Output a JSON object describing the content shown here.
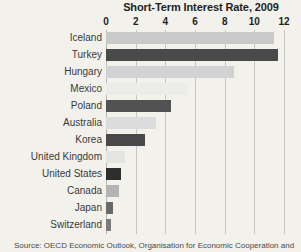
{
  "chart_data": {
    "type": "bar",
    "orientation": "horizontal",
    "title": "Short-Term Interest Rate, 2009",
    "xlabel": "",
    "ylabel": "",
    "xlim": [
      0,
      12
    ],
    "xticks": [
      0,
      2,
      4,
      6,
      8,
      10,
      12
    ],
    "xtick_labels": [
      "0",
      "2",
      "4",
      "6",
      "8",
      "10",
      "12"
    ],
    "grid": "vertical",
    "legend": "none",
    "categories": [
      "Iceland",
      "Turkey",
      "Hungary",
      "Mexico",
      "Poland",
      "Australia",
      "Korea",
      "United Kingdom",
      "United States",
      "Canada",
      "Japan",
      "Switzerland"
    ],
    "values": [
      11.3,
      11.6,
      8.6,
      5.5,
      4.4,
      3.4,
      2.6,
      1.3,
      1.0,
      0.9,
      0.5,
      0.35
    ],
    "bar_colors": [
      "#c9c9c9",
      "#4a4a4a",
      "#d2d2d2",
      "#ececeb",
      "#525252",
      "#dcdcdc",
      "#484848",
      "#e4e4e3",
      "#2e2e2e",
      "#b4b4b4",
      "#6a6a6a",
      "#7b7b7b"
    ],
    "source": "Source: OECD Economic Outlook, Organisation for Economic Cooperation and"
  },
  "style": {
    "background": "#f2f1ec",
    "gridline_color": "#c8c6c0",
    "title_color": "#221f1f",
    "label_color": "#3a3a3a"
  }
}
